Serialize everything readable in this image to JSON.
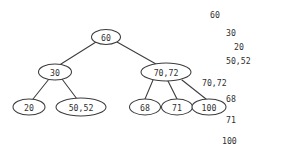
{
  "diagram": {
    "type": "multiway-search-tree",
    "background_color": "#ffffff",
    "stroke_color": "#3c3c3c",
    "text_color": "#2f2f2f",
    "nodes": [
      {
        "id": "root",
        "label": "60",
        "cx": 106,
        "cy": 37,
        "rx": 14.5,
        "ry": 7.5
      },
      {
        "id": "n30",
        "label": "30",
        "cx": 55,
        "cy": 72,
        "rx": 16.5,
        "ry": 8.0
      },
      {
        "id": "n7072",
        "label": "70,72",
        "cx": 166,
        "cy": 72,
        "rx": 25.0,
        "ry": 9.0
      },
      {
        "id": "n20",
        "label": "20",
        "cx": 29,
        "cy": 107,
        "rx": 16.0,
        "ry": 8.0
      },
      {
        "id": "n5052",
        "label": "50,52",
        "cx": 81,
        "cy": 107,
        "rx": 25.0,
        "ry": 9.0
      },
      {
        "id": "n68",
        "label": "68",
        "cx": 145,
        "cy": 107,
        "rx": 15.5,
        "ry": 8.0
      },
      {
        "id": "n71",
        "label": "71",
        "cx": 177,
        "cy": 107,
        "rx": 15.5,
        "ry": 8.0
      },
      {
        "id": "n100",
        "label": "100",
        "cx": 209,
        "cy": 107,
        "rx": 17.0,
        "ry": 8.0
      }
    ],
    "edges": [
      {
        "from": "root",
        "to": "n30",
        "x1": 96,
        "y1": 42,
        "x2": 61,
        "y2": 64
      },
      {
        "from": "root",
        "to": "n7072",
        "x1": 117,
        "y1": 42,
        "x2": 156,
        "y2": 64
      },
      {
        "from": "n30",
        "to": "n20",
        "x1": 49,
        "y1": 79,
        "x2": 33,
        "y2": 99
      },
      {
        "from": "n30",
        "to": "n5052",
        "x1": 62,
        "y1": 79,
        "x2": 77,
        "y2": 99
      },
      {
        "from": "n7072",
        "to": "n68",
        "x1": 153,
        "y1": 80,
        "x2": 145,
        "y2": 99
      },
      {
        "from": "n7072",
        "to": "n71",
        "x1": 168,
        "y1": 81,
        "x2": 177,
        "y2": 99
      },
      {
        "from": "n7072",
        "to": "n100",
        "x1": 182,
        "y1": 80,
        "x2": 206,
        "y2": 99
      }
    ]
  },
  "listing": {
    "lines": [
      {
        "text": "60",
        "indent": 0,
        "x": 14,
        "y": 10
      },
      {
        "text": "30",
        "indent": 1,
        "x": 30,
        "y": 28
      },
      {
        "text": "20",
        "indent": 2,
        "x": 38,
        "y": 42
      },
      {
        "text": "50,52",
        "indent": 2,
        "x": 30,
        "y": 56
      },
      {
        "text": "70,72",
        "indent": 0,
        "x": 6,
        "y": 78
      },
      {
        "text": "68",
        "indent": 1,
        "x": 30,
        "y": 94
      },
      {
        "text": "71",
        "indent": 1,
        "x": 30,
        "y": 115
      },
      {
        "text": "100",
        "indent": 1,
        "x": 26,
        "y": 136
      }
    ]
  }
}
